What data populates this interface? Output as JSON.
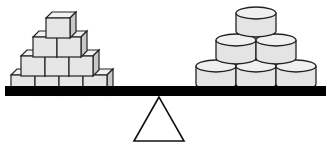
{
  "diagram": {
    "type": "balance-scale",
    "left_pan": {
      "shape": "cube",
      "rows": [
        1,
        2,
        3,
        4
      ],
      "total": 10
    },
    "right_pan": {
      "shape": "cylinder",
      "rows": [
        1,
        2,
        3
      ],
      "total": 6
    },
    "beam_state": "level",
    "colors": {
      "block_fill": "#e6e6e6",
      "block_side": "#c8c8c8",
      "block_top": "#f2f2f2",
      "outline": "#222222",
      "beam": "#000000",
      "fulcrum_fill": "#ffffff"
    }
  }
}
